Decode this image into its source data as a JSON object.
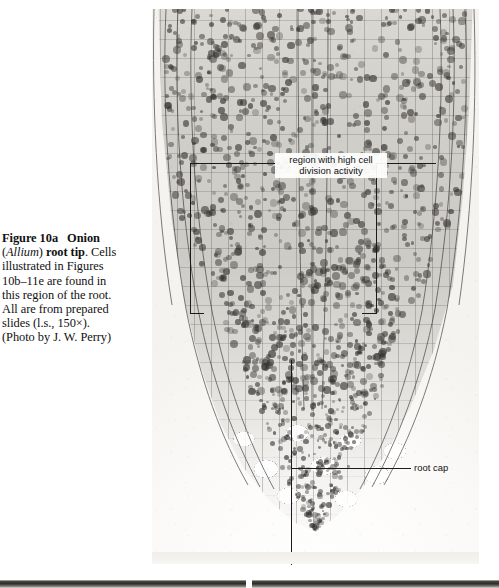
{
  "figure": {
    "caption_lines": [
      {
        "segments": [
          {
            "text": "Figure 10a",
            "style": "bold"
          },
          {
            "text": "   ",
            "style": "gap"
          },
          {
            "text": "Onion",
            "style": "bold"
          }
        ]
      },
      {
        "segments": [
          {
            "text": "(",
            "style": "plain"
          },
          {
            "text": "Allium",
            "style": "italic"
          },
          {
            "text": ") ",
            "style": "plain"
          },
          {
            "text": "root tip",
            "style": "bold"
          },
          {
            "text": ". Cells",
            "style": "plain"
          }
        ]
      },
      {
        "segments": [
          {
            "text": "illustrated in Figures",
            "style": "plain"
          }
        ]
      },
      {
        "segments": [
          {
            "text": "10b–11e are found in",
            "style": "plain"
          }
        ]
      },
      {
        "segments": [
          {
            "text": "this region of the root.",
            "style": "plain"
          }
        ]
      },
      {
        "segments": [
          {
            "text": "All are from prepared",
            "style": "plain"
          }
        ]
      },
      {
        "segments": [
          {
            "text": "slides (l.s., 150×).",
            "style": "plain"
          }
        ]
      },
      {
        "segments": [
          {
            "text": "(Photo by J. W. Perry)",
            "style": "plain"
          }
        ]
      }
    ],
    "caption_plain": "Figure 10a   Onion (Allium) root tip. Cells illustrated in Figures 10b–11e are found in this region of the root. All are from prepared slides (l.s., 150×). (Photo by J. W. Perry)",
    "figure_number": "Figure 10a",
    "title": "Onion",
    "organism": "Allium",
    "subject": "root tip",
    "magnification": "150×",
    "section_type": "l.s.",
    "credit": "(Photo by J. W. Perry)"
  },
  "micrograph": {
    "alt": "Longitudinal section light micrograph of an onion (Allium) root tip showing files of meristematic cells with dark-stained nuclei tapering to a rounded root cap",
    "colors": {
      "paper": "#ffffff",
      "slide_background": "#f4f3ef",
      "tissue": "#bdbbb5",
      "cell_wall": "#3c3a36",
      "nucleus": "#343230",
      "annotation_line": "#1b1b1b",
      "label_text": "#101010",
      "label_background": "#ffffff"
    }
  },
  "annotations": [
    {
      "id": "region-high-cell-division",
      "label": "region with high cell division activity",
      "line1": "region with high cell",
      "line2": "division activity",
      "type": "bracket-callout"
    },
    {
      "id": "root-cap",
      "label": "root cap",
      "type": "leader-callout"
    }
  ]
}
